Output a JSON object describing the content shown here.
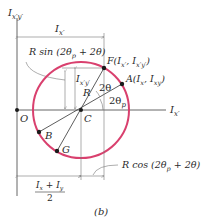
{
  "figure": {
    "caption": "(b)",
    "colors": {
      "circle": "#d9406e",
      "lines": "#333333",
      "dimension": "#777777"
    },
    "axes": {
      "vertical": {
        "label_main": "I",
        "label_sub": "x′y′"
      },
      "horizontal": {
        "label_main": "I",
        "label_sub": "x′"
      },
      "origin_label": "O"
    },
    "center_label": "C",
    "radius_label": "R",
    "points": {
      "F": {
        "label": "F(I",
        "sub1": "x′",
        "mid": ", I",
        "sub2": "x′y′",
        "end": ")"
      },
      "A": {
        "label": "A(I",
        "sub1": "x",
        "mid": ", I",
        "sub2": "xy",
        "end": ")"
      },
      "B": {
        "label": "B"
      },
      "G": {
        "label": "G"
      }
    },
    "angles": {
      "two_theta": "2θ",
      "two_theta_p_main": "2θ",
      "two_theta_p_sub": "p"
    },
    "dimensions": {
      "top_width": {
        "main": "I",
        "sub": "x′"
      },
      "r_sin": {
        "pre": "R sin (2θ",
        "sub": "p",
        "post": " + 2θ)"
      },
      "ixy_height": {
        "main": "I",
        "sub": "x′y′"
      },
      "r_cos": {
        "pre": "R cos (2θ",
        "sub": "p",
        "post": " + 2θ)"
      },
      "avg": {
        "num_a": "I",
        "num_a_sub": "x",
        "plus": " + ",
        "num_b": "I",
        "num_b_sub": "y",
        "den": "2"
      }
    }
  }
}
